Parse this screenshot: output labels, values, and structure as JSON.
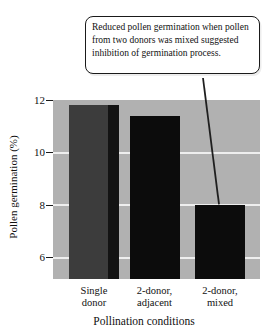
{
  "chart_data": {
    "type": "bar",
    "title": "",
    "xlabel": "Pollination conditions",
    "ylabel": "Pollen germination (%)",
    "categories": [
      "Single donor",
      "2-donor, adjacent",
      "2-donor, mixed"
    ],
    "category_lines": [
      [
        "Single",
        "donor"
      ],
      [
        "2-donor,",
        "adjacent"
      ],
      [
        "2-donor,",
        "mixed"
      ]
    ],
    "values": [
      11.8,
      11.4,
      8.0
    ],
    "bar_colors": [
      "#3c3c3c",
      "#0c0c0c",
      "#0c0c0c"
    ],
    "bar_edge_colors": [
      "#131313",
      null,
      null
    ],
    "ylim": [
      5.2,
      12
    ],
    "yticks": [
      12,
      10,
      8,
      6
    ],
    "gridlines": [
      10,
      8,
      6
    ],
    "grid": true,
    "legend": false,
    "plot_bg_color": "#b1b1b1",
    "gridline_color": "#eeeeee",
    "annotation": {
      "text": "Reduced pollen germination when pollen from two donors was mixed suggested inhibition of germination process.",
      "target_category": "2-donor, mixed"
    }
  }
}
